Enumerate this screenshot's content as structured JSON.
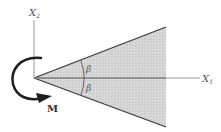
{
  "diagram": {
    "title": "",
    "axes": {
      "x1": {
        "label": "X",
        "subscript": "1"
      },
      "x2": {
        "label": "X",
        "subscript": "2"
      }
    },
    "wedge": {
      "half_angle_label_upper": "β",
      "half_angle_label_lower": "β",
      "fill_color": "#d2d2d2",
      "edge_color": "#3a3a3a"
    },
    "moment": {
      "label": "M",
      "direction": "clockwise"
    },
    "colors": {
      "axis": "#9a9a9a",
      "stroke": "#2b2b2b",
      "background": "#ffffff"
    }
  }
}
